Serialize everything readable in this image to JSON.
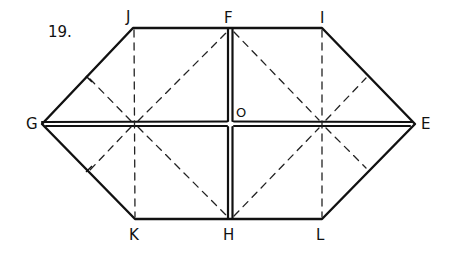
{
  "figure": {
    "number": "19.",
    "labels": {
      "J": "J",
      "F": "F",
      "I": "I",
      "G": "G",
      "E": "E",
      "K": "K",
      "H": "H",
      "L": "L",
      "O": "O"
    }
  },
  "points": {
    "J": [
      133,
      28
    ],
    "F": [
      230,
      28
    ],
    "I": [
      322,
      28
    ],
    "G": [
      42,
      124
    ],
    "O": [
      230,
      124
    ],
    "E": [
      415,
      124
    ],
    "K": [
      135,
      219
    ],
    "H": [
      230,
      219
    ],
    "L": [
      322,
      219
    ],
    "P1": [
      135,
      124
    ],
    "P2": [
      322,
      124
    ]
  },
  "colors": {
    "ink": "#111111",
    "background": "#ffffff"
  }
}
